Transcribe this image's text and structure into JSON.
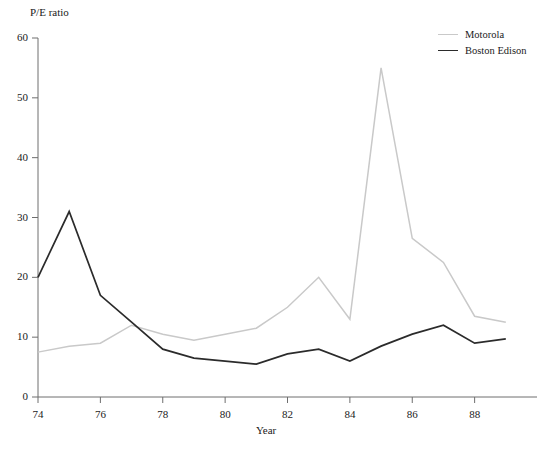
{
  "chart_data": {
    "type": "line",
    "title": "",
    "xlabel": "Year",
    "ylabel": "P/E ratio",
    "x": [
      74,
      75,
      76,
      77,
      78,
      79,
      80,
      81,
      82,
      83,
      84,
      85,
      86,
      87,
      88,
      89
    ],
    "xlim": [
      74,
      90
    ],
    "ylim": [
      0,
      60
    ],
    "xticks": [
      74,
      76,
      78,
      80,
      82,
      84,
      86,
      88
    ],
    "yticks": [
      0,
      10,
      20,
      30,
      40,
      50,
      60
    ],
    "grid": false,
    "legend_position": "top-right",
    "series": [
      {
        "name": "Motorola",
        "color": "#c9c9c9",
        "values": [
          7.5,
          8.5,
          9.0,
          12.0,
          10.5,
          9.5,
          10.5,
          11.5,
          15.0,
          20.0,
          13.0,
          55.0,
          26.5,
          22.5,
          13.5,
          12.5
        ]
      },
      {
        "name": "Boston Edison",
        "color": "#2b2b2b",
        "values": [
          20.0,
          31.0,
          17.0,
          12.5,
          8.0,
          6.5,
          6.0,
          5.5,
          7.2,
          8.0,
          6.0,
          8.5,
          10.5,
          12.0,
          9.0,
          9.7
        ]
      }
    ]
  },
  "axis": {
    "y_title": "P/E ratio",
    "x_title": "Year",
    "ytick_labels": [
      "60",
      "50",
      "40",
      "30",
      "20",
      "10",
      "0"
    ],
    "xtick_labels": [
      "74",
      "76",
      "78",
      "80",
      "82",
      "84",
      "86",
      "88"
    ]
  },
  "legend": {
    "items": [
      {
        "label": "Motorola"
      },
      {
        "label": "Boston Edison"
      }
    ]
  },
  "caption": {
    "text": ""
  }
}
